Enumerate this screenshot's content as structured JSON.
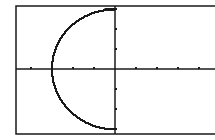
{
  "chart_data": {
    "type": "line",
    "title": "",
    "xlabel": "",
    "ylabel": "",
    "xlim": [
      -4.7,
      4.7
    ],
    "ylim": [
      -3.2,
      3.2
    ],
    "xscale": 1,
    "yscale": 1,
    "grid": false,
    "legend": null,
    "series": [
      {
        "name": "x = -sqrt(9 - y^2)",
        "x": [
          0,
          -0.77,
          -1.44,
          -1.98,
          -2.4,
          -2.71,
          -2.9,
          -2.99,
          -3.0,
          -2.99,
          -2.9,
          -2.71,
          -2.4,
          -1.98,
          -1.44,
          -0.77,
          0
        ],
        "y": [
          3,
          2.9,
          2.63,
          2.25,
          1.8,
          1.28,
          0.77,
          0.26,
          0,
          -0.26,
          -0.77,
          -1.28,
          -1.8,
          -2.25,
          -2.63,
          -2.9,
          -3
        ]
      }
    ]
  },
  "colors": {
    "ink": "#1a1a1a",
    "background": "#ffffff"
  }
}
